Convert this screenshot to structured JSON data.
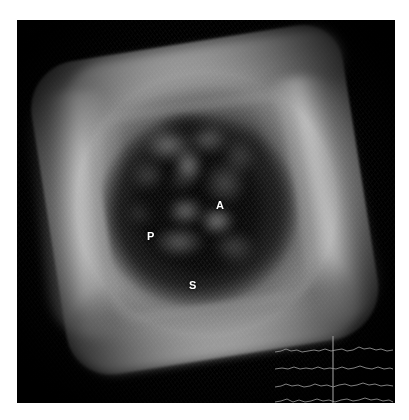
{
  "modality": {
    "type": "3D/4D volume-rendered ultrasound",
    "display_mode": "volume render with en-face cropped cube",
    "background_color": "#000000",
    "page_background_color": "#ffffff",
    "annotation_color": "#ffffff"
  },
  "image_frame": {
    "name": "ultrasound-scan-frame",
    "left": 17,
    "top": 20,
    "width": 378,
    "height": 383
  },
  "annotations": [
    {
      "label": "A",
      "name": "annotation-a",
      "x": 199,
      "y": 180,
      "meaning": "anterior leaflet"
    },
    {
      "label": "P",
      "name": "annotation-p",
      "x": 130,
      "y": 211,
      "meaning": "posterior leaflet"
    },
    {
      "label": "S",
      "name": "annotation-s",
      "x": 172,
      "y": 260,
      "meaning": "septal leaflet"
    }
  ],
  "ecg": {
    "name": "ecg-trace-panel",
    "trace_color": "#8f8f8f",
    "cursor_color": "#9a9a9a",
    "cursor_x": 58,
    "trace_count": 4,
    "baselines": [
      21,
      38,
      56,
      71
    ],
    "traces": [
      {
        "name": "ecg-trace-1",
        "points": "0,22 6,21 11,19 16,21 22,20 27,22 33,21 39,20 44,21 50,19 56,21 61,20 67,19 72,21 78,20 84,17 89,19 95,18 101,20 106,19 112,21 118,20"
      },
      {
        "name": "ecg-trace-2",
        "points": "0,39 7,38 13,39 19,37 25,39 31,38 37,39 43,37 49,39 55,38 61,39 67,37 73,39 79,38 85,36 91,38 97,39 103,37 109,39 115,38 118,39"
      },
      {
        "name": "ecg-trace-3",
        "points": "0,57 6,56 11,54 17,56 23,55 29,57 35,56 40,54 46,56 52,55 58,57 64,55 70,54 76,56 82,55 88,53 94,55 100,54 106,56 112,55 118,56"
      },
      {
        "name": "ecg-trace-4",
        "points": "0,72 6,71 12,69 18,72 24,70 30,72 36,71 42,69 48,71 54,70 60,72 66,70 72,69 78,71 84,70 90,68 96,70 102,69 108,71 114,70 118,72"
      }
    ]
  },
  "tissue_blobs": [
    {
      "left": 128,
      "top": 108,
      "w": 46,
      "h": 34,
      "color": "rgba(170,170,170,0.55)"
    },
    {
      "left": 156,
      "top": 126,
      "w": 30,
      "h": 40,
      "color": "rgba(185,185,185,0.62)"
    },
    {
      "left": 172,
      "top": 104,
      "w": 38,
      "h": 30,
      "color": "rgba(150,150,150,0.48)"
    },
    {
      "left": 186,
      "top": 140,
      "w": 44,
      "h": 46,
      "color": "rgba(140,140,140,0.46)"
    },
    {
      "left": 114,
      "top": 140,
      "w": 34,
      "h": 32,
      "color": "rgba(120,120,120,0.42)"
    },
    {
      "left": 148,
      "top": 176,
      "w": 40,
      "h": 30,
      "color": "rgba(175,175,175,0.58)"
    },
    {
      "left": 182,
      "top": 186,
      "w": 36,
      "h": 30,
      "color": "rgba(190,190,190,0.62)"
    },
    {
      "left": 136,
      "top": 206,
      "w": 52,
      "h": 32,
      "color": "rgba(160,160,160,0.52)"
    },
    {
      "left": 196,
      "top": 210,
      "w": 42,
      "h": 34,
      "color": "rgba(130,130,130,0.44)"
    },
    {
      "left": 110,
      "top": 180,
      "w": 28,
      "h": 26,
      "color": "rgba(110,110,110,0.38)"
    },
    {
      "left": 206,
      "top": 120,
      "w": 32,
      "h": 36,
      "color": "rgba(115,115,115,0.40)"
    },
    {
      "left": 150,
      "top": 150,
      "w": 26,
      "h": 24,
      "color": "rgba(60,60,60,0.55)"
    },
    {
      "left": 118,
      "top": 166,
      "w": 44,
      "h": 40,
      "color": "rgba(10,10,10,0.85)"
    },
    {
      "left": 160,
      "top": 236,
      "w": 56,
      "h": 22,
      "color": "rgba(8,8,8,0.88)"
    },
    {
      "left": 140,
      "top": 92,
      "w": 60,
      "h": 28,
      "color": "rgba(10,10,10,0.75)"
    }
  ]
}
